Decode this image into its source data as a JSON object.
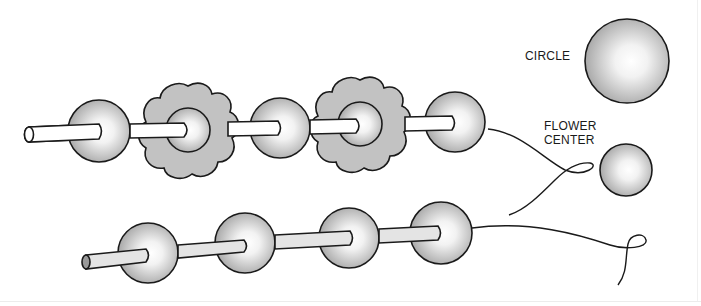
{
  "labels": {
    "circle": "CIRCLE",
    "flower_center_line1": "FLOWER",
    "flower_center_line2": "CENTER"
  },
  "colors": {
    "outline": "#1a1a1a",
    "bead_light": "#ffffff",
    "bead_dark": "#a8a8a8",
    "flower_fill": "#c2c2c2",
    "rod_top_fill": "#ffffff",
    "rod_bottom_fill": "#e4e4e4",
    "rod_end_fill": "#9a9a9a"
  },
  "diagram": {
    "top_strand": {
      "items": [
        "bead",
        "flower",
        "bead",
        "flower",
        "bead"
      ]
    },
    "bottom_strand": {
      "items": [
        "bead",
        "bead",
        "bead",
        "bead"
      ]
    },
    "legend": [
      {
        "shape": "large circle",
        "label": "CIRCLE"
      },
      {
        "shape": "small circle",
        "label": "FLOWER CENTER"
      }
    ]
  }
}
